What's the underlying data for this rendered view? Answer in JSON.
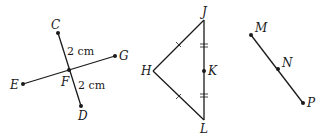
{
  "figures": {
    "intersecting_segments": {
      "labels": {
        "C": "C",
        "D": "D",
        "E": "E",
        "F": "F",
        "G": "G"
      },
      "measure_top": "2 cm",
      "measure_bottom": "2 cm"
    },
    "triangle": {
      "labels": {
        "H": "H",
        "J": "J",
        "K": "K",
        "L": "L"
      }
    },
    "segment": {
      "labels": {
        "M": "M",
        "N": "N",
        "P": "P"
      }
    }
  },
  "colors": {
    "ink": "#1a1a1a",
    "background": "#ffffff"
  }
}
